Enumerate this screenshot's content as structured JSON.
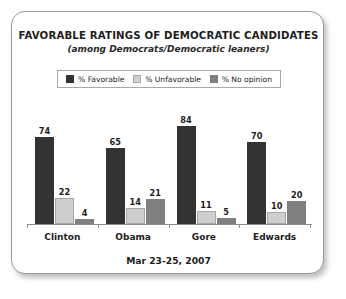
{
  "chart_data": {
    "type": "bar",
    "title": "FAVORABLE RATINGS OF DEMOCRATIC CANDIDATES",
    "subtitle": "(among Democrats/Democratic leaners)",
    "footer": "Mar 23-25, 2007",
    "categories": [
      "Clinton",
      "Obama",
      "Gore",
      "Edwards"
    ],
    "series": [
      {
        "name": "% Favorable",
        "color": "#333333",
        "values": [
          74,
          65,
          84,
          70
        ]
      },
      {
        "name": "% Unfavorable",
        "color": "#cfcfcf",
        "values": [
          22,
          14,
          11,
          10
        ]
      },
      {
        "name": "% No opinion",
        "color": "#808080",
        "values": [
          4,
          21,
          5,
          20
        ]
      }
    ],
    "ylim": [
      0,
      100
    ],
    "xlabel": "",
    "ylabel": "",
    "grid": false,
    "legend_position": "top"
  },
  "legend": {
    "items": [
      {
        "label": "% Favorable"
      },
      {
        "label": "% Unfavorable"
      },
      {
        "label": "% No opinion"
      }
    ]
  }
}
